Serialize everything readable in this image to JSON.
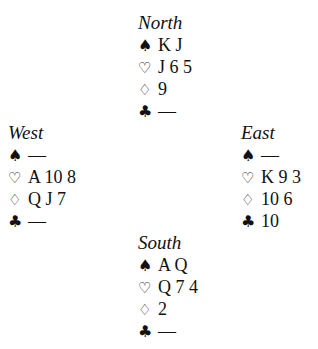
{
  "diagram": {
    "north": {
      "title": "North",
      "spades": "K J",
      "hearts": "J 6 5",
      "diamonds": "9",
      "clubs": "—"
    },
    "west": {
      "title": "West",
      "spades": "—",
      "hearts": "A 10 8",
      "diamonds": "Q J 7",
      "clubs": "—"
    },
    "east": {
      "title": "East",
      "spades": "—",
      "hearts": "K 9 3",
      "diamonds": "10 6",
      "clubs": "10"
    },
    "south": {
      "title": "South",
      "spades": "A Q",
      "hearts": "Q 7 4",
      "diamonds": "2",
      "clubs": "—"
    },
    "suit_icons": {
      "spade": "♠",
      "heart": "♡",
      "diamond": "♢",
      "club": "♣"
    }
  }
}
